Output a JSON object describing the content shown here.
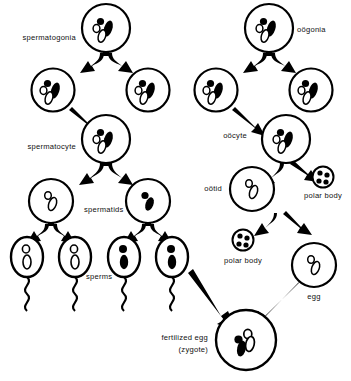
{
  "diagram": {
    "colors": {
      "ink": "#000000",
      "background": "#ffffff",
      "chromosome_dark": "#000000",
      "chromosome_light": "#ffffff"
    },
    "labels": {
      "spermatogonia": "spermatogonia",
      "spermatocyte": "spermatocyte",
      "spermatids": "spermatids",
      "sperms": "sperms",
      "oogonia": "oögonia",
      "oocyte": "oöcyte",
      "ootid": "oötid",
      "polar_body_upper": "polar body",
      "polar_body_lower": "polar body",
      "egg": "egg",
      "zygote_line1": "fertilized egg",
      "zygote_line2": "(zygote)"
    },
    "male_line": {
      "name": "spermatogenesis",
      "stages": [
        {
          "id": "spermatogonium",
          "label": "spermatogonia",
          "count": 1,
          "chromosomes": "diploid-mixed"
        },
        {
          "id": "spermatogonia-daughters",
          "label": "spermatogonia",
          "count": 2,
          "chromosomes": "diploid-mixed"
        },
        {
          "id": "spermatocyte",
          "label": "spermatocyte",
          "count": 1,
          "chromosomes": "diploid-mixed"
        },
        {
          "id": "spermatids",
          "label": "spermatids",
          "count": 2,
          "chromosomes": "haploid"
        },
        {
          "id": "sperms",
          "label": "sperms",
          "count": 4,
          "chromosomes": "haploid"
        }
      ]
    },
    "female_line": {
      "name": "oogenesis",
      "stages": [
        {
          "id": "oogonium",
          "label": "oögonia",
          "count": 1,
          "chromosomes": "diploid-mixed"
        },
        {
          "id": "oogonia-daughters",
          "label": "oögonia",
          "count": 2,
          "chromosomes": "diploid-mixed"
        },
        {
          "id": "oocyte",
          "label": "oöcyte",
          "count": 1,
          "chromosomes": "diploid-mixed"
        },
        {
          "id": "ootid",
          "label": "oötid",
          "count": 1,
          "chromosomes": "haploid-light"
        },
        {
          "id": "polar-bodies",
          "label": "polar body",
          "count": 2,
          "chromosomes": "condensed"
        },
        {
          "id": "egg",
          "label": "egg",
          "count": 1,
          "chromosomes": "haploid-light"
        }
      ]
    },
    "fertilization": {
      "product": "fertilized egg (zygote)",
      "inputs": [
        "sperm",
        "egg"
      ],
      "chromosomes": "diploid-mixed"
    }
  }
}
